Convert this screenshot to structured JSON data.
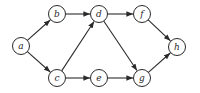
{
  "diagram": {
    "type": "directed-graph",
    "radius": 8.5,
    "colors": {
      "stroke": "#2a2a2a",
      "fill": "#ffffff"
    },
    "nodes": [
      {
        "id": "a",
        "label": "a",
        "x": 21,
        "y": 46
      },
      {
        "id": "b",
        "label": "b",
        "x": 57,
        "y": 14
      },
      {
        "id": "c",
        "label": "c",
        "x": 57,
        "y": 78
      },
      {
        "id": "d",
        "label": "d",
        "x": 99,
        "y": 14
      },
      {
        "id": "e",
        "label": "e",
        "x": 99,
        "y": 78
      },
      {
        "id": "f",
        "label": "f",
        "x": 142,
        "y": 14
      },
      {
        "id": "g",
        "label": "g",
        "x": 142,
        "y": 78
      },
      {
        "id": "h",
        "label": "h",
        "x": 177,
        "y": 47
      }
    ],
    "edges": [
      {
        "from": "a",
        "to": "b"
      },
      {
        "from": "a",
        "to": "c"
      },
      {
        "from": "b",
        "to": "d"
      },
      {
        "from": "c",
        "to": "d"
      },
      {
        "from": "c",
        "to": "e"
      },
      {
        "from": "d",
        "to": "f"
      },
      {
        "from": "d",
        "to": "g"
      },
      {
        "from": "e",
        "to": "g"
      },
      {
        "from": "f",
        "to": "h"
      },
      {
        "from": "g",
        "to": "h"
      }
    ]
  }
}
